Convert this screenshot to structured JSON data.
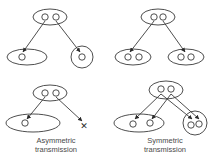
{
  "diagram": {
    "stroke_color": "#3a3a3a",
    "background": "#ffffff",
    "panels": [
      {
        "id": "top-left",
        "description": "Parent pair splits: one allele to ellipse with one circle, other to concentric circle",
        "source": {
          "cx": 50,
          "cy": 17,
          "rx": 17,
          "ry": 8,
          "dots": [
            [
              45,
              17
            ],
            [
              56,
              17
            ]
          ]
        },
        "targets": [
          {
            "shape": "ellipse",
            "cx": 27,
            "cy": 57,
            "rx": 20,
            "ry": 8,
            "dots": [
              [
                22,
                57
              ]
            ]
          },
          {
            "shape": "circle",
            "cx": 82,
            "cy": 57,
            "r": 11,
            "dots": [
              [
                82,
                57
              ]
            ]
          }
        ],
        "arrows": [
          [
            45,
            21,
            23,
            52
          ],
          [
            56,
            21,
            80,
            52
          ]
        ]
      },
      {
        "id": "top-right",
        "description": "Parent pair, each daughter ellipse with two circles",
        "source": {
          "cx": 158,
          "cy": 17,
          "rx": 17,
          "ry": 8,
          "dots": [
            [
              154,
              17
            ],
            [
              163,
              17
            ]
          ]
        },
        "targets": [
          {
            "shape": "ellipse",
            "cx": 133,
            "cy": 57,
            "rx": 18,
            "ry": 8,
            "dots": [
              [
                128,
                57
              ],
              [
                139,
                57
              ]
            ]
          },
          {
            "shape": "ellipse",
            "cx": 186,
            "cy": 57,
            "rx": 18,
            "ry": 8,
            "dots": [
              [
                181,
                57
              ],
              [
                191,
                57
              ]
            ]
          }
        ],
        "arrows": [
          [
            154,
            21,
            130,
            52
          ],
          [
            163,
            21,
            185,
            52
          ]
        ]
      },
      {
        "id": "bottom-left",
        "caption_lines": [
          "Asymmetric",
          "transmission"
        ],
        "source": {
          "cx": 50,
          "cy": 93,
          "rx": 17,
          "ry": 8,
          "dots": [
            [
              45,
              93
            ],
            [
              56,
              93
            ]
          ]
        },
        "targets": [
          {
            "shape": "ellipse",
            "cx": 33,
            "cy": 123,
            "rx": 27,
            "ry": 9,
            "dots": [
              [
                25,
                123
              ]
            ]
          }
        ],
        "arrows": [
          [
            45,
            97,
            27,
            119
          ],
          [
            56,
            97,
            82,
            121
          ]
        ],
        "lost_marker": {
          "symbol": "✕",
          "x": 84,
          "y": 126
        }
      },
      {
        "id": "bottom-right",
        "caption_lines": [
          "Symmetric",
          "transmission"
        ],
        "source": {
          "cx": 166,
          "cy": 90,
          "rx": 17,
          "ry": 9,
          "dots": [
            [
              161,
              89
            ],
            [
              171,
              89
            ]
          ]
        },
        "targets": [
          {
            "shape": "ellipse",
            "cx": 139,
            "cy": 123,
            "rx": 25,
            "ry": 9,
            "dots": [
              [
                133,
                124
              ],
              [
                150,
                123
              ]
            ]
          },
          {
            "shape": "circle",
            "cx": 195,
            "cy": 123,
            "r": 12,
            "dots": [
              [
                191,
                125
              ],
              [
                199,
                124
              ]
            ]
          }
        ],
        "arrows": [
          [
            161,
            94,
            135,
            119
          ],
          [
            171,
            94,
            152,
            119
          ],
          [
            161,
            94,
            192,
            119
          ],
          [
            171,
            94,
            199,
            119
          ]
        ]
      }
    ]
  },
  "captions": {
    "asymmetric": {
      "line1": "Asymmetric",
      "line2": "transmission"
    },
    "symmetric": {
      "line1": "Symmetric",
      "line2": "transmission"
    }
  }
}
